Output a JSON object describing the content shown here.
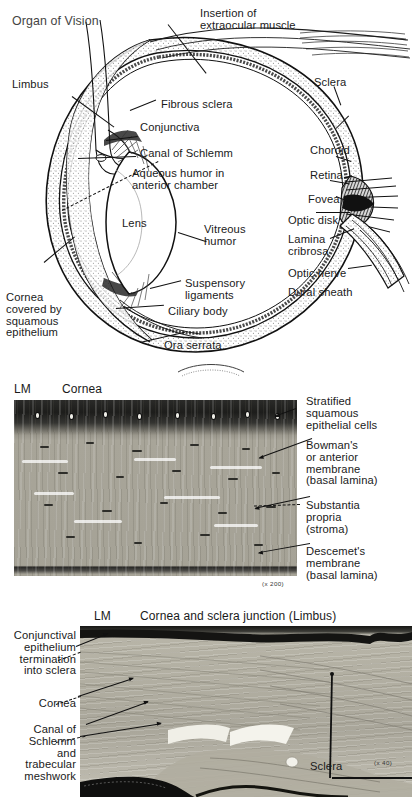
{
  "page": {
    "background": "#ffffff",
    "ink": "#111111"
  },
  "eye_panel": {
    "name": "organ-of-vision-diagram",
    "title": "Organ of Vision",
    "labels": {
      "limbus": "Limbus",
      "insertion_of_extraocular_muscle": "Insertion of\nextraocular muscle",
      "fibrous_sclera": "Fibrous sclera",
      "conjunctiva": "Conjunctiva",
      "canal_of_schlemm": "Canal of Schlemm",
      "aqueous_humor": "Aqueous humor in\nanterior chamber",
      "lens": "Lens",
      "vitreous_humor": "Vitreous\nhumor",
      "suspensory_ligaments": "Suspensory\nligaments",
      "ciliary_body": "Ciliary body",
      "ora_serrata": "Ora serrata",
      "cornea_covered": "Cornea\ncovered by\nsquamous\nepithelium",
      "sclera": "Sclera",
      "choroid": "Choroid",
      "retina": "Retina",
      "fovea": "Fovea",
      "optic_disk": "Optic disk",
      "lamina_cribrosa": "Lamina\ncribrosa",
      "optic_nerve": "Optic nerve",
      "dural_sheath": "Dural sheath"
    }
  },
  "cornea_panel": {
    "name": "cornea-light-micrograph",
    "method": "LM",
    "title": "Cornea",
    "magnification": "(x 200)",
    "labels": {
      "stratified_squamous": "Stratified\nsquamous\nepithelial cells",
      "bowmans_membrane": "Bowman's\nor anterior\nmembrane\n(basal lamina)",
      "substantia_propria": "Substantia\npropria\n(stroma)",
      "descemets_membrane": "Descemet's\nmembrane\n(basal lamina)"
    }
  },
  "limbus_panel": {
    "name": "limbus-light-micrograph",
    "method": "LM",
    "title": "Cornea and sclera junction (Limbus)",
    "magnification": "(x 40)",
    "labels": {
      "conjunctival_epithelium": "Conjunctival\nepithelium\ntermination\ninto sclera",
      "cornea": "Cornea",
      "canal_of_schlemm": "Canal of\nSchlemm\nand\ntrabecular\nmeshwork",
      "sclera": "Sclera"
    }
  }
}
